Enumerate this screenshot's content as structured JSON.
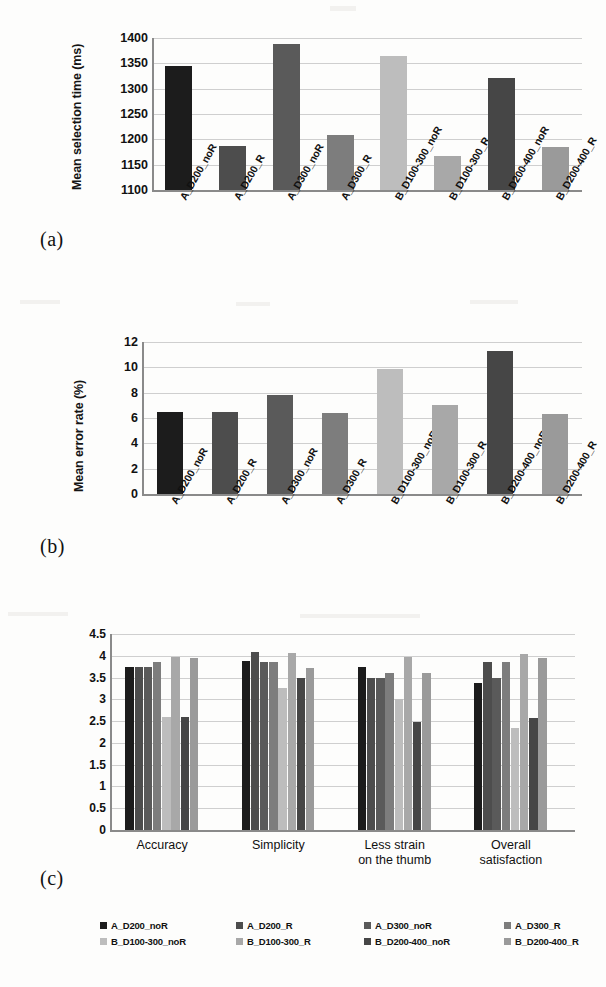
{
  "figure": {
    "panels": [
      "(a)",
      "(b)",
      "(c)"
    ]
  },
  "conditions": [
    "A_D200_noR",
    "A_D200_R",
    "A_D300_noR",
    "A_D300_R",
    "B_D100-300_noR",
    "B_D100-300_R",
    "B_D200-400_noR",
    "B_D200-400_R"
  ],
  "palette": [
    "#1c1c1c",
    "#4d4d4d",
    "#5a5a5a",
    "#7d7d7d",
    "#bdbdbd",
    "#a8a8a8",
    "#464646",
    "#9a9a9a"
  ],
  "legend": {
    "items": [
      {
        "label": "A_D200_noR",
        "color": "#1c1c1c"
      },
      {
        "label": "A_D200_R",
        "color": "#4d4d4d"
      },
      {
        "label": "A_D300_noR",
        "color": "#5a5a5a"
      },
      {
        "label": "A_D300_R",
        "color": "#7d7d7d"
      },
      {
        "label": "B_D100-300_noR",
        "color": "#bdbdbd"
      },
      {
        "label": "B_D100-300_R",
        "color": "#a8a8a8"
      },
      {
        "label": "B_D200-400_noR",
        "color": "#464646"
      },
      {
        "label": "B_D200-400_R",
        "color": "#9a9a9a"
      }
    ]
  },
  "chart_data": [
    {
      "id": "a",
      "panel": "(a)",
      "type": "bar",
      "title": "",
      "xlabel": "",
      "ylabel": "Mean selection time (ms)",
      "ylim": [
        1100,
        1400
      ],
      "yticks": [
        1100,
        1150,
        1200,
        1250,
        1300,
        1350,
        1400
      ],
      "grid": true,
      "legend_position": "none",
      "categories": [
        "A_D200_noR",
        "A_D200_R",
        "A_D300_noR",
        "A_D300_R",
        "B_D100-300_noR",
        "B_D100-300_R",
        "B_D200-400_noR",
        "B_D200-400_R"
      ],
      "values": [
        1345,
        1187,
        1388,
        1208,
        1365,
        1168,
        1321,
        1185
      ]
    },
    {
      "id": "b",
      "panel": "(b)",
      "type": "bar",
      "title": "",
      "xlabel": "",
      "ylabel": "Mean error rate (%)",
      "ylim": [
        0,
        12
      ],
      "yticks": [
        0,
        2,
        4,
        6,
        8,
        10,
        12
      ],
      "grid": true,
      "legend_position": "none",
      "categories": [
        "A_D200_noR",
        "A_D200_R",
        "A_D300_noR",
        "A_D300_R",
        "B_D100-300_noR",
        "B_D100-300_R",
        "B_D200-400_noR",
        "B_D200-400_R"
      ],
      "values": [
        6.5,
        6.5,
        7.8,
        6.4,
        9.9,
        7.0,
        11.3,
        6.3
      ]
    },
    {
      "id": "c",
      "panel": "(c)",
      "type": "bar",
      "title": "",
      "xlabel": "",
      "ylabel": "",
      "ylim": [
        0,
        4.5
      ],
      "yticks": [
        0,
        0.5,
        1,
        1.5,
        2,
        2.5,
        3,
        3.5,
        4,
        4.5
      ],
      "ytick_labels": [
        "0",
        "0.5",
        "1",
        "1.5",
        "2",
        "2.5",
        "3",
        "3.5",
        "4",
        "4.5"
      ],
      "grid": true,
      "legend_position": "bottom",
      "categories": [
        "Accuracy",
        "Simplicity",
        "Less strain\non the thumb",
        "Overall\nsatisfaction"
      ],
      "series": [
        {
          "name": "A_D200_noR",
          "values": [
            3.75,
            3.87,
            3.75,
            3.37
          ]
        },
        {
          "name": "A_D200_R",
          "values": [
            3.75,
            4.08,
            3.5,
            3.85
          ]
        },
        {
          "name": "A_D300_noR",
          "values": [
            3.75,
            3.85,
            3.5,
            3.48
          ]
        },
        {
          "name": "A_D300_R",
          "values": [
            3.85,
            3.85,
            3.6,
            3.85
          ]
        },
        {
          "name": "B_D100-300_noR",
          "values": [
            2.6,
            3.25,
            3.0,
            2.35
          ]
        },
        {
          "name": "B_D100-300_R",
          "values": [
            3.97,
            4.07,
            3.97,
            4.05
          ]
        },
        {
          "name": "B_D200-400_noR",
          "values": [
            2.6,
            3.5,
            2.48,
            2.58
          ]
        },
        {
          "name": "B_D200-400_R",
          "values": [
            3.96,
            3.72,
            3.6,
            3.95
          ]
        }
      ]
    }
  ]
}
